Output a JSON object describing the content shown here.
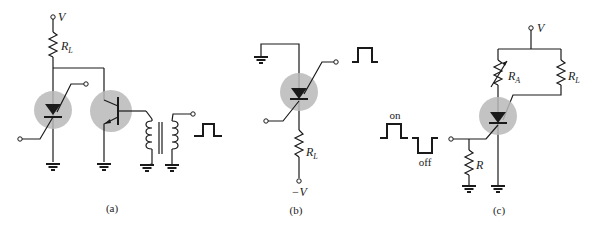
{
  "figure": {
    "panels": [
      {
        "id": "a",
        "caption": "(a)",
        "labels": {
          "supply": "V",
          "load": "R",
          "load_sub": "L"
        },
        "components": [
          "supply-terminal",
          "load-resistor",
          "scr",
          "npn-transistor",
          "pulse-transformer",
          "pulse-waveform",
          "ground x4"
        ]
      },
      {
        "id": "b",
        "caption": "(b)",
        "labels": {
          "supply": "−V",
          "load": "R",
          "load_sub": "L"
        },
        "components": [
          "ground",
          "scr",
          "load-resistor",
          "negative-supply-terminal",
          "pulse-waveform"
        ]
      },
      {
        "id": "c",
        "caption": "(c)",
        "labels": {
          "supply": "V",
          "ra": "R",
          "ra_sub": "A",
          "rl": "R",
          "rl_sub": "L",
          "r": "R",
          "on": "on",
          "off": "off"
        },
        "components": [
          "supply-terminal",
          "variable-resistor-RA",
          "load-resistor-RL",
          "scr",
          "gate-resistor-R",
          "on-pulse",
          "off-pulse",
          "ground x2"
        ]
      }
    ]
  }
}
